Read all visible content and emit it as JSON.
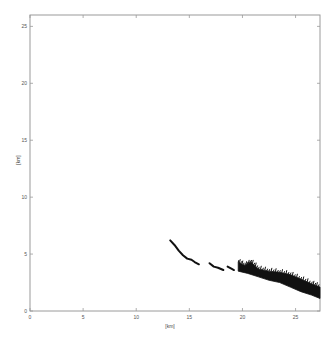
{
  "chart_data": {
    "type": "scatter",
    "title": "",
    "xlabel": "[km]",
    "ylabel": "[km]",
    "xlim": [
      0,
      27.3
    ],
    "ylim": [
      0,
      26
    ],
    "xticks": [
      0,
      5,
      10,
      15,
      20,
      25
    ],
    "yticks": [
      0,
      5,
      10,
      15,
      20,
      25
    ],
    "xtick_labels": [
      "0",
      "5",
      "10",
      "15",
      "20",
      "25"
    ],
    "ytick_labels": [
      "0",
      "5",
      "10",
      "15",
      "20",
      "25"
    ],
    "grid": false,
    "legend": null,
    "color": "#111111",
    "series": [
      {
        "name": "segment-1",
        "style": "thin-line",
        "points": [
          [
            13.2,
            6.2
          ],
          [
            13.6,
            5.8
          ],
          [
            14.0,
            5.3
          ],
          [
            14.4,
            4.9
          ],
          [
            14.8,
            4.6
          ],
          [
            15.2,
            4.5
          ],
          [
            15.5,
            4.3
          ],
          [
            15.9,
            4.1
          ]
        ]
      },
      {
        "name": "segment-2",
        "style": "thin-line",
        "points": [
          [
            16.9,
            4.2
          ],
          [
            17.3,
            3.9
          ],
          [
            17.7,
            3.8
          ],
          [
            18.2,
            3.6
          ]
        ]
      },
      {
        "name": "segment-3",
        "style": "thin-line",
        "points": [
          [
            18.6,
            3.9
          ],
          [
            19.0,
            3.7
          ],
          [
            19.2,
            3.6
          ]
        ]
      },
      {
        "name": "segment-4-band",
        "style": "filled-band",
        "top": [
          [
            19.6,
            4.3
          ],
          [
            20.2,
            4.0
          ],
          [
            20.8,
            4.3
          ],
          [
            21.5,
            3.7
          ],
          [
            22.5,
            3.5
          ],
          [
            23.5,
            3.4
          ],
          [
            24.5,
            3.2
          ],
          [
            25.5,
            2.8
          ],
          [
            26.5,
            2.4
          ],
          [
            27.3,
            2.1
          ]
        ],
        "bottom": [
          [
            19.6,
            3.5
          ],
          [
            20.5,
            3.3
          ],
          [
            21.5,
            3.0
          ],
          [
            22.5,
            2.7
          ],
          [
            23.5,
            2.5
          ],
          [
            24.5,
            2.1
          ],
          [
            25.5,
            1.7
          ],
          [
            26.5,
            1.4
          ],
          [
            27.3,
            1.1
          ]
        ]
      }
    ]
  }
}
